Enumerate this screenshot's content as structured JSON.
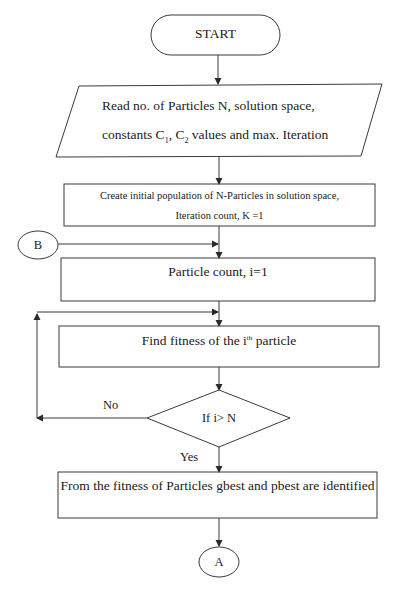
{
  "flowchart": {
    "start": {
      "label": "START"
    },
    "input": {
      "line1": "Read no. of Particles N, solution space,",
      "line2_prefix": "constants C",
      "c1_sub": "1",
      "line2_mid": ", C",
      "c2_sub": "2",
      "line2_suffix": " values and max. Iteration"
    },
    "init": {
      "line1": "Create initial population of N-Particles in solution space,",
      "line2": "Iteration count, K =1"
    },
    "connector_b": {
      "label": "B"
    },
    "particle_count": {
      "label": "Particle count, i=1"
    },
    "fitness": {
      "prefix": "Find fitness of the i",
      "sup": "th",
      "suffix": " particle"
    },
    "decision": {
      "label": "If i> N",
      "no_label": "No",
      "yes_label": "Yes"
    },
    "identify": {
      "label": "From the fitness of Particles gbest and pbest are identified"
    },
    "connector_a": {
      "label": "A"
    }
  },
  "colors": {
    "stroke": "#3a3a3a",
    "text": "#1a1a1a",
    "background": "#ffffff"
  }
}
